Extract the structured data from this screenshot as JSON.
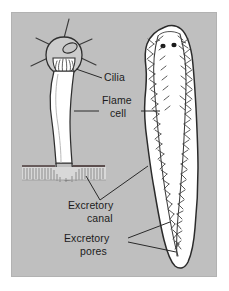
{
  "figure": {
    "panel": {
      "background_color": "#bfbfbf",
      "outer_background_color": "#ffffff",
      "x": 11,
      "y": 12,
      "width": 206,
      "height": 265
    },
    "ink_color": "#2a2a2a",
    "body_fill_color": "#ffffff",
    "cilia_band_color": "#d8d8d8"
  },
  "labels": [
    {
      "id": "cilia",
      "text": "Cilia",
      "x": 104,
      "y": 81,
      "anchor": "start"
    },
    {
      "id": "flame-cell-line1",
      "text": "Flame",
      "x": 102,
      "y": 104,
      "anchor": "start"
    },
    {
      "id": "flame-cell-line2",
      "text": "cell",
      "x": 110,
      "y": 117,
      "anchor": "start"
    },
    {
      "id": "excretory-canal-line1",
      "text": "Excretory",
      "x": 68,
      "y": 209,
      "anchor": "start"
    },
    {
      "id": "excretory-canal-line2",
      "text": "canal",
      "x": 87,
      "y": 222,
      "anchor": "start"
    },
    {
      "id": "excretory-pores-line1",
      "text": "Excretory",
      "x": 64,
      "y": 242,
      "anchor": "start"
    },
    {
      "id": "excretory-pores-line2",
      "text": "pores",
      "x": 80,
      "y": 255,
      "anchor": "start"
    }
  ],
  "diagram_parts": {
    "flame_cell": {
      "name": "flame-cell",
      "head_cx": 64,
      "head_cy": 52,
      "nucleus": "oval nucleus inside cell head",
      "cilia_tuft": "tuft of cilia projecting into tubule lumen",
      "processes": 5
    },
    "excretory_tubule": {
      "name": "excretory-tubule",
      "description": "white duct running from flame cell down to body wall"
    },
    "body_wall": {
      "name": "body-wall",
      "y": 166,
      "description": "horizontal body wall with ciliated surface band"
    },
    "planarian": {
      "name": "planarian-body",
      "eyespots": 2,
      "canal_networks": 2,
      "description": "whole planarian showing two branching excretory canals"
    }
  }
}
